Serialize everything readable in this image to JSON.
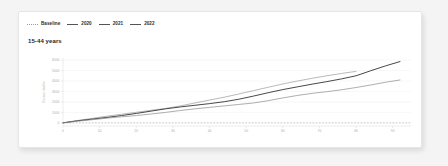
{
  "card": {
    "title": "15-44 years"
  },
  "legend": {
    "items": [
      {
        "label": "Baseline",
        "style": "dashed",
        "color": "#9a9a9a"
      },
      {
        "label": "2020",
        "style": "solid",
        "color": "#9b9b9b"
      },
      {
        "label": "2021",
        "style": "solid",
        "color": "#3d3d3d"
      },
      {
        "label": "2022",
        "style": "solid",
        "color": "#777777"
      }
    ]
  },
  "chart_data": {
    "type": "line",
    "title": "15-44 years",
    "xlabel": "",
    "ylabel": "Excess deaths",
    "xlim": [
      0,
      95
    ],
    "ylim": [
      -300,
      6200
    ],
    "grid": true,
    "legend_position": "top-left",
    "xticks": [
      0,
      10,
      20,
      30,
      40,
      50,
      60,
      70,
      80,
      90
    ],
    "yticks": [
      0,
      1000,
      2000,
      3000,
      4000,
      5000,
      6000
    ],
    "ytick_labels": [
      "0",
      "1000",
      "2000",
      "3000",
      "4000",
      "5000",
      "6000"
    ],
    "xtick_labels": [
      "0",
      "10",
      "20",
      "30",
      "40",
      "50",
      "60",
      "70",
      "80",
      "90"
    ],
    "series": [
      {
        "name": "Baseline",
        "color": "#b9b9b9",
        "style": "dashed",
        "x": [
          0,
          95
        ],
        "values": [
          0,
          0
        ]
      },
      {
        "name": "2020",
        "color": "#9b9b9b",
        "style": "solid",
        "x": [
          0,
          4,
          8,
          12,
          16,
          20,
          24,
          28,
          32,
          36,
          40,
          44,
          48,
          52,
          56,
          60,
          64,
          68,
          72,
          76,
          80
        ],
        "values": [
          0,
          230,
          430,
          640,
          820,
          1010,
          1200,
          1380,
          1620,
          1900,
          2180,
          2450,
          2760,
          3080,
          3400,
          3720,
          4000,
          4260,
          4500,
          4720,
          4920
        ]
      },
      {
        "name": "2021",
        "color": "#3d3d3d",
        "style": "solid",
        "x": [
          0,
          4,
          8,
          12,
          16,
          20,
          24,
          28,
          32,
          36,
          40,
          44,
          48,
          52,
          56,
          60,
          64,
          68,
          72,
          76,
          80,
          84,
          88,
          92
        ],
        "values": [
          0,
          200,
          360,
          520,
          700,
          900,
          1120,
          1340,
          1520,
          1680,
          1840,
          2020,
          2260,
          2560,
          2880,
          3180,
          3440,
          3700,
          3940,
          4200,
          4500,
          4980,
          5440,
          5860
        ]
      },
      {
        "name": "2022",
        "color": "#8b8b8b",
        "style": "solid",
        "x": [
          0,
          4,
          8,
          12,
          16,
          20,
          24,
          28,
          32,
          36,
          40,
          44,
          48,
          52,
          56,
          60,
          64,
          68,
          72,
          76,
          80,
          84,
          88,
          92
        ],
        "values": [
          0,
          160,
          300,
          450,
          580,
          700,
          840,
          1000,
          1180,
          1340,
          1480,
          1620,
          1760,
          1900,
          2120,
          2380,
          2620,
          2820,
          2980,
          3160,
          3380,
          3620,
          3880,
          4100
        ]
      }
    ]
  }
}
